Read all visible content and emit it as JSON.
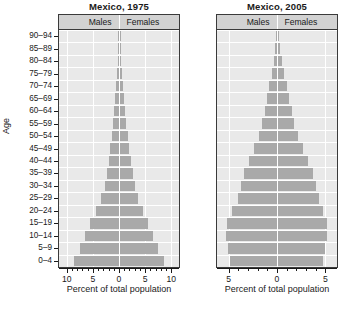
{
  "figure": {
    "y_axis_title": "Age",
    "age_groups": [
      "0–4",
      "5–9",
      "10–14",
      "15–19",
      "20–24",
      "25–29",
      "30–34",
      "35–39",
      "40–44",
      "45–49",
      "50–54",
      "55–59",
      "60–64",
      "65–69",
      "70–74",
      "75–79",
      "80–84",
      "85–89",
      "90–94"
    ],
    "strip_labels": {
      "males": "Males",
      "females": "Females"
    },
    "x_axis_title": "Percent of total population",
    "colors": {
      "bar": "#a9a9a9",
      "panel_bg": "#e9e9e9",
      "strip_bg": "#d2d2d2",
      "grid": "#ffffff",
      "axis": "#1a1a1a"
    }
  },
  "chart_data": [
    {
      "type": "bar",
      "title": "Mexico, 1975",
      "subtype": "population-pyramid",
      "orientation": "horizontal",
      "xlabel": "Percent of total population",
      "ylabel": "Age",
      "grid": true,
      "legend": "strip-header",
      "xlim": [
        -11.5,
        11.5
      ],
      "xticks": [
        -10,
        -5,
        0,
        5,
        10
      ],
      "xtick_labels": [
        "10",
        "5",
        "0",
        "5",
        "10"
      ],
      "xtick_minor_step": 1,
      "categories": [
        "0–4",
        "5–9",
        "10–14",
        "15–19",
        "20–24",
        "25–29",
        "30–34",
        "35–39",
        "40–44",
        "45–49",
        "50–54",
        "55–59",
        "60–64",
        "65–69",
        "70–74",
        "75–79",
        "80–84",
        "85–89",
        "90–94"
      ],
      "series": [
        {
          "name": "Males",
          "side": "left",
          "values": [
            8.6,
            7.4,
            6.5,
            5.5,
            4.4,
            3.4,
            2.7,
            2.3,
            2.0,
            1.7,
            1.4,
            1.1,
            0.9,
            0.7,
            0.5,
            0.35,
            0.2,
            0.1,
            0.05
          ]
        },
        {
          "name": "Females",
          "side": "right",
          "values": [
            8.4,
            7.2,
            6.3,
            5.4,
            4.4,
            3.5,
            2.8,
            2.4,
            2.1,
            1.8,
            1.5,
            1.2,
            1.0,
            0.8,
            0.6,
            0.4,
            0.25,
            0.12,
            0.06
          ]
        }
      ]
    },
    {
      "type": "bar",
      "title": "Mexico, 2005",
      "subtype": "population-pyramid",
      "orientation": "horizontal",
      "xlabel": "Percent of total population",
      "ylabel": "Age",
      "grid": true,
      "legend": "strip-header",
      "xlim": [
        -6.2,
        6.2
      ],
      "xticks": [
        -5,
        0,
        5
      ],
      "xtick_labels": [
        "5",
        "0",
        "5"
      ],
      "xtick_minor_step": 1,
      "categories": [
        "0–4",
        "5–9",
        "10–14",
        "15–19",
        "20–24",
        "25–29",
        "30–34",
        "35–39",
        "40–44",
        "45–49",
        "50–54",
        "55–59",
        "60–64",
        "65–69",
        "70–74",
        "75–79",
        "80–84",
        "85–89",
        "90–94"
      ],
      "series": [
        {
          "name": "Males",
          "side": "left",
          "values": [
            4.9,
            5.1,
            5.3,
            5.2,
            4.6,
            4.0,
            3.7,
            3.4,
            2.9,
            2.4,
            1.9,
            1.5,
            1.2,
            1.0,
            0.8,
            0.55,
            0.35,
            0.2,
            0.1
          ]
        },
        {
          "name": "Females",
          "side": "right",
          "values": [
            4.7,
            4.9,
            5.1,
            5.1,
            4.7,
            4.2,
            3.9,
            3.6,
            3.1,
            2.6,
            2.1,
            1.7,
            1.4,
            1.1,
            0.9,
            0.65,
            0.45,
            0.25,
            0.12
          ]
        }
      ]
    }
  ]
}
